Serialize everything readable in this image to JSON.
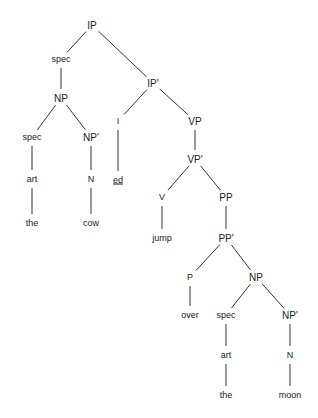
{
  "diagram": {
    "type": "syntax-tree",
    "line_color": "#333333",
    "nodes": [
      {
        "id": "ip",
        "label": "IP",
        "x": 92,
        "y": 25,
        "cat": true
      },
      {
        "id": "spec1",
        "label": "spec",
        "x": 61,
        "y": 59
      },
      {
        "id": "np1",
        "label": "NP",
        "x": 61,
        "y": 98,
        "cat": true
      },
      {
        "id": "spec2",
        "label": "spec",
        "x": 32,
        "y": 137
      },
      {
        "id": "art1",
        "label": "art",
        "x": 32,
        "y": 179
      },
      {
        "id": "the1",
        "label": "the",
        "x": 32,
        "y": 223
      },
      {
        "id": "npbar1",
        "label": "NP'",
        "x": 91,
        "y": 137,
        "cat": true
      },
      {
        "id": "n1",
        "label": "N",
        "x": 91,
        "y": 179
      },
      {
        "id": "cow",
        "label": "cow",
        "x": 91,
        "y": 223
      },
      {
        "id": "ipbar",
        "label": "IP'",
        "x": 153,
        "y": 83,
        "cat": true
      },
      {
        "id": "i",
        "label": "I",
        "x": 118,
        "y": 121
      },
      {
        "id": "ed",
        "label": "ed",
        "x": 118,
        "y": 180,
        "underline": true
      },
      {
        "id": "vp",
        "label": "VP",
        "x": 195,
        "y": 121,
        "cat": true
      },
      {
        "id": "vpbar",
        "label": "VP'",
        "x": 195,
        "y": 159,
        "cat": true
      },
      {
        "id": "v",
        "label": "V",
        "x": 162,
        "y": 197
      },
      {
        "id": "jump",
        "label": "jump",
        "x": 162,
        "y": 238
      },
      {
        "id": "pp",
        "label": "PP",
        "x": 226,
        "y": 197,
        "cat": true
      },
      {
        "id": "ppbar",
        "label": "PP'",
        "x": 226,
        "y": 238,
        "cat": true
      },
      {
        "id": "p",
        "label": "P",
        "x": 190,
        "y": 277
      },
      {
        "id": "over",
        "label": "over",
        "x": 190,
        "y": 315
      },
      {
        "id": "np2",
        "label": "NP",
        "x": 256,
        "y": 277,
        "cat": true
      },
      {
        "id": "spec3",
        "label": "spec",
        "x": 226,
        "y": 315
      },
      {
        "id": "art2",
        "label": "art",
        "x": 226,
        "y": 355
      },
      {
        "id": "the2",
        "label": "the",
        "x": 226,
        "y": 395
      },
      {
        "id": "npbar2",
        "label": "NP'",
        "x": 290,
        "y": 315,
        "cat": true
      },
      {
        "id": "n2",
        "label": "N",
        "x": 290,
        "y": 355
      },
      {
        "id": "moon",
        "label": "moon",
        "x": 290,
        "y": 395
      }
    ],
    "edges": [
      [
        "ip",
        "spec1"
      ],
      [
        "ip",
        "ipbar"
      ],
      [
        "spec1",
        "np1"
      ],
      [
        "np1",
        "spec2"
      ],
      [
        "np1",
        "npbar1"
      ],
      [
        "spec2",
        "art1"
      ],
      [
        "art1",
        "the1"
      ],
      [
        "npbar1",
        "n1"
      ],
      [
        "n1",
        "cow"
      ],
      [
        "ipbar",
        "i"
      ],
      [
        "ipbar",
        "vp"
      ],
      [
        "i",
        "ed"
      ],
      [
        "vp",
        "vpbar"
      ],
      [
        "vpbar",
        "v"
      ],
      [
        "vpbar",
        "pp"
      ],
      [
        "v",
        "jump"
      ],
      [
        "pp",
        "ppbar"
      ],
      [
        "ppbar",
        "p"
      ],
      [
        "ppbar",
        "np2"
      ],
      [
        "p",
        "over"
      ],
      [
        "np2",
        "spec3"
      ],
      [
        "np2",
        "npbar2"
      ],
      [
        "spec3",
        "art2"
      ],
      [
        "art2",
        "the2"
      ],
      [
        "npbar2",
        "n2"
      ],
      [
        "n2",
        "moon"
      ]
    ]
  }
}
